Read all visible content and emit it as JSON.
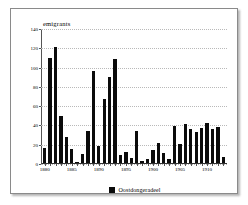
{
  "figure": {
    "background_color": "#ffffff",
    "frame_border_color": "#8a8a8a",
    "bar_color": "#0b0b0b"
  },
  "legend": {
    "label": "Oostdongeradeel",
    "swatch_name": "legend-color-swatch"
  },
  "chart_data": {
    "type": "bar",
    "title": "emigrants",
    "xlabel": "",
    "ylabel": "",
    "ylim": [
      0,
      140
    ],
    "ytick_labels": [
      "0",
      "20",
      "40",
      "60",
      "80",
      "100",
      "120",
      "140"
    ],
    "ytick_values": [
      0,
      20,
      40,
      60,
      80,
      100,
      120,
      140
    ],
    "xtick_labels": [
      "1880",
      "1885",
      "1890",
      "1895",
      "1900",
      "1905",
      "1910"
    ],
    "xtick_values": [
      1880,
      1885,
      1890,
      1895,
      1900,
      1905,
      1910
    ],
    "xlim": [
      1879,
      1914
    ],
    "grid": "horizontal-dotted",
    "legend_position": "bottom-center",
    "series": [
      {
        "name": "Oostdongeradeel",
        "color": "#0b0b0b",
        "categories": [
          1880,
          1881,
          1882,
          1883,
          1884,
          1885,
          1886,
          1887,
          1888,
          1889,
          1890,
          1891,
          1892,
          1893,
          1894,
          1895,
          1896,
          1897,
          1898,
          1899,
          1900,
          1901,
          1902,
          1903,
          1904,
          1905,
          1906,
          1907,
          1908,
          1909,
          1910,
          1911,
          1912,
          1913
        ],
        "values": [
          16,
          109,
          120,
          49,
          27,
          15,
          1,
          9,
          33,
          95,
          18,
          66,
          89,
          108,
          8,
          11,
          5,
          33,
          2,
          4,
          13,
          21,
          10,
          4,
          38,
          20,
          40,
          35,
          32,
          36,
          41,
          35,
          37,
          6
        ]
      }
    ]
  }
}
